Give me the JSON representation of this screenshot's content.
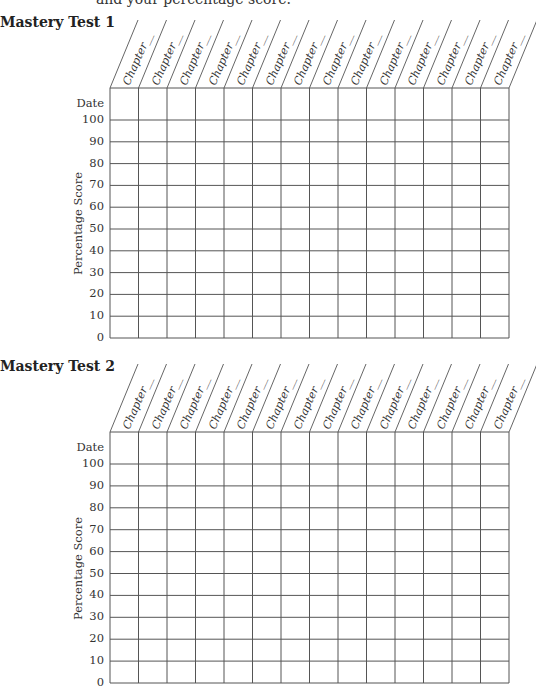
{
  "page": {
    "intro_text": "and your percentage score."
  },
  "tests": [
    {
      "title": "Mastery Test 1",
      "ylabel": "Percentage Score",
      "date_label": "Date",
      "column_header": "Chapter__",
      "columns": 14,
      "y_ticks": [
        "100",
        "90",
        "80",
        "70",
        "60",
        "50",
        "40",
        "30",
        "20",
        "10",
        "0"
      ]
    },
    {
      "title": "Mastery Test 2",
      "ylabel": "Percentage Score",
      "date_label": "Date",
      "column_header": "Chapter__",
      "columns": 14,
      "y_ticks": [
        "100",
        "90",
        "80",
        "70",
        "60",
        "50",
        "40",
        "30",
        "20",
        "10",
        "0"
      ]
    }
  ],
  "chart_data": [
    {
      "type": "table",
      "title": "Mastery Test 1",
      "xlabel": "Chapter__",
      "ylabel": "Percentage Score",
      "categories": [
        "Chapter__",
        "Chapter__",
        "Chapter__",
        "Chapter__",
        "Chapter__",
        "Chapter__",
        "Chapter__",
        "Chapter__",
        "Chapter__",
        "Chapter__",
        "Chapter__",
        "Chapter__",
        "Chapter__",
        "Chapter__"
      ],
      "rows": [
        "Date",
        "100",
        "90",
        "80",
        "70",
        "60",
        "50",
        "40",
        "30",
        "20",
        "10",
        "0"
      ],
      "values": [],
      "ylim": [
        0,
        100
      ],
      "grid": true
    },
    {
      "type": "table",
      "title": "Mastery Test 2",
      "xlabel": "Chapter__",
      "ylabel": "Percentage Score",
      "categories": [
        "Chapter__",
        "Chapter__",
        "Chapter__",
        "Chapter__",
        "Chapter__",
        "Chapter__",
        "Chapter__",
        "Chapter__",
        "Chapter__",
        "Chapter__",
        "Chapter__",
        "Chapter__",
        "Chapter__",
        "Chapter__"
      ],
      "rows": [
        "Date",
        "100",
        "90",
        "80",
        "70",
        "60",
        "50",
        "40",
        "30",
        "20",
        "10",
        "0"
      ],
      "values": [],
      "ylim": [
        0,
        100
      ],
      "grid": true
    }
  ]
}
